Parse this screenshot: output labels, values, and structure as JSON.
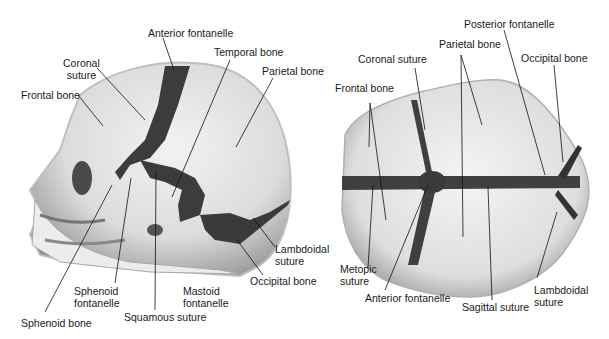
{
  "figure": {
    "panels": [
      {
        "id": "lateral-view",
        "labels": {
          "anterior_fontanelle": "Anterior fontanelle",
          "coronal_suture": "Coronal\nsuture",
          "temporal_bone": "Temporal bone",
          "parietal_bone": "Parietal bone",
          "frontal_bone": "Frontal bone",
          "lambdoidal_suture": "Lambdoidal\nsuture",
          "occipital_bone": "Occipital bone",
          "sphenoid_fontanelle": "Sphenoid\nfontanelle",
          "mastoid_fontanelle": "Mastoid\nfontanelle",
          "squamous_suture": "Squamous suture",
          "sphenoid_bone": "Sphenoid bone"
        }
      },
      {
        "id": "superior-view",
        "labels": {
          "posterior_fontanelle": "Posterior fontanelle",
          "parietal_bone": "Parietal bone",
          "coronal_suture": "Coronal suture",
          "occipital_bone": "Occipital bone",
          "frontal_bone": "Frontal bone",
          "metopic_suture": "Metopic\nsuture",
          "anterior_fontanelle": "Anterior fontanelle",
          "sagittal_suture": "Sagittal suture",
          "lambdoidal_suture": "Lambdoidal\nsuture"
        }
      }
    ],
    "colors": {
      "bone": "#e6e6e6",
      "suture": "#3a3a3a",
      "outline": "#9a9a9a",
      "leader": "#111111"
    }
  }
}
